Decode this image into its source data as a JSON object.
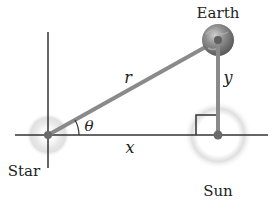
{
  "labels": {
    "star": "Star",
    "earth": "Earth",
    "sun": "Sun",
    "r": "r",
    "x": "x",
    "y": "y",
    "theta": "θ"
  },
  "colors": {
    "axis": "#333333",
    "segment": "#8a8a8a",
    "glow": "#c8c8c8",
    "earth": "#777777"
  }
}
